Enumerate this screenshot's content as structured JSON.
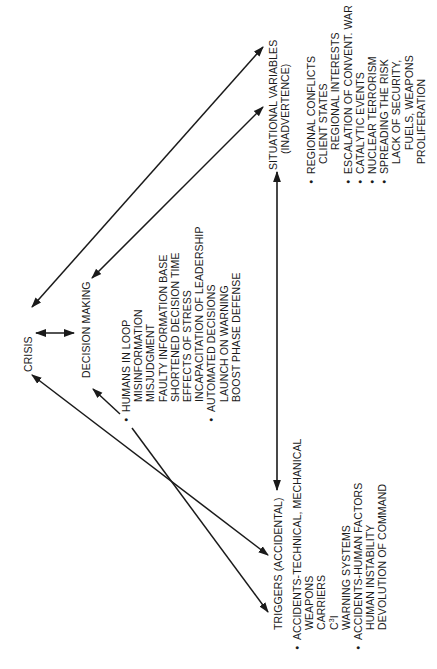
{
  "diagram": {
    "nodes": {
      "crisis": {
        "label": "CRISIS"
      },
      "decision_making": {
        "label": "DECISION MAKING",
        "items": [
          {
            "text": "HUMANS IN LOOP",
            "bullet": true,
            "level": 0
          },
          {
            "text": "MISINFORMATION",
            "bullet": false,
            "level": 1
          },
          {
            "text": "MISJUDGMENT",
            "bullet": false,
            "level": 1
          },
          {
            "text": "FAULTY INFORMATION BASE",
            "bullet": false,
            "level": 1
          },
          {
            "text": "SHORTENED DECISION TIME",
            "bullet": false,
            "level": 1
          },
          {
            "text": "EFFECTS OF STRESS",
            "bullet": false,
            "level": 1
          },
          {
            "text": "INCAPACITATION OF LEADERSHIP",
            "bullet": false,
            "level": 1
          },
          {
            "text": "AUTOMATED DECISIONS",
            "bullet": true,
            "level": 0
          },
          {
            "text": "LAUNCH ON WARNING",
            "bullet": false,
            "level": 1
          },
          {
            "text": "BOOST PHASE DEFENSE",
            "bullet": false,
            "level": 1
          }
        ]
      },
      "situational": {
        "label": "SITUATIONAL VARIABLES",
        "sublabel": "(INADVERTENCE)",
        "items": [
          {
            "text": "REGIONAL CONFLICTS",
            "bullet": true,
            "level": 0
          },
          {
            "text": "CLIENT STATES",
            "bullet": false,
            "level": 1
          },
          {
            "text": "REGIONAL INTERESTS",
            "bullet": false,
            "level": 2
          },
          {
            "text": "ESCALATION OF CONVENT. WAR",
            "bullet": true,
            "level": 0
          },
          {
            "text": "CATALYTIC EVENTS",
            "bullet": true,
            "level": 0
          },
          {
            "text": "NUCLEAR TERRORISM",
            "bullet": true,
            "level": 0
          },
          {
            "text": "SPREADING THE RISK",
            "bullet": true,
            "level": 0
          },
          {
            "text": "LACK OF SECURITY,",
            "bullet": false,
            "level": 1
          },
          {
            "text": "FUELS, WEAPONS",
            "bullet": false,
            "level": 2
          },
          {
            "text": "PROLIFERATION",
            "bullet": false,
            "level": 1
          }
        ]
      },
      "triggers": {
        "label": "TRIGGERS (ACCIDENTAL)",
        "items": [
          {
            "text": "ACCIDENTS-TECHNICAL, MECHANICAL",
            "bullet": true,
            "level": 0
          },
          {
            "text": "WEAPONS",
            "bullet": false,
            "level": 1
          },
          {
            "text": "CARRIERS",
            "bullet": false,
            "level": 1
          },
          {
            "text": "C",
            "sup": "3",
            "suffix": "I",
            "bullet": false,
            "level": 1
          },
          {
            "text": "WARNING SYSTEMS",
            "bullet": false,
            "level": 1
          },
          {
            "text": "ACCIDENTS-HUMAN FACTORS",
            "bullet": true,
            "level": 0
          },
          {
            "text": "HUMAN INSTABILITY",
            "bullet": false,
            "level": 1
          },
          {
            "text": "DEVOLUTION OF COMMAND",
            "bullet": false,
            "level": 1
          }
        ]
      }
    },
    "edges": [
      {
        "from": "crisis",
        "to": "decision_making",
        "type": "bidirectional"
      },
      {
        "from": "crisis",
        "to": "situational",
        "type": "bidirectional"
      },
      {
        "from": "decision_making",
        "to": "situational",
        "type": "bidirectional"
      },
      {
        "from": "crisis",
        "to": "triggers",
        "type": "bidirectional"
      },
      {
        "from": "decision_making",
        "to": "triggers",
        "type": "bidirectional"
      },
      {
        "from": "situational",
        "to": "triggers",
        "type": "bidirectional"
      }
    ],
    "orientation": "rotated-90-ccw"
  }
}
